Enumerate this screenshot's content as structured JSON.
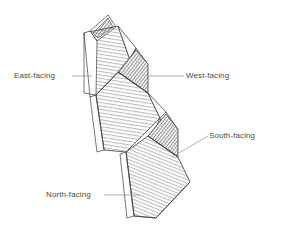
{
  "figure": {
    "kind": "architectural-isometric-line-drawing",
    "background_color": "#ffffff",
    "line_color": "#3c3c3c",
    "hatch_light_color": "#6e6e6e",
    "hatch_dark_color": "#2b2b2b",
    "leader_color": "#9a9a9a",
    "label_color": "#4a4a4a"
  },
  "labels": {
    "east": "East-facing",
    "west": "West-facing",
    "south": "South-facing",
    "north": "North-facing"
  },
  "panels": [
    {
      "id": "east",
      "name": "East-facing",
      "shading": "light-horizontal-hatch",
      "label": "East-facing"
    },
    {
      "id": "west",
      "name": "West-facing",
      "shading": "dark-dense-hatch",
      "label": "West-facing"
    },
    {
      "id": "south",
      "name": "South-facing",
      "shading": "dark-dense-hatch",
      "label": "South-facing"
    },
    {
      "id": "north",
      "name": "North-facing",
      "shading": "light-diagonal-hatch",
      "label": "North-facing"
    }
  ],
  "leaders": [
    {
      "id": "east-leader",
      "from": "East-facing",
      "style": "horizontal"
    },
    {
      "id": "west-leader",
      "from": "West-facing",
      "style": "horizontal"
    },
    {
      "id": "south-leader",
      "from": "South-facing",
      "style": "diagonal"
    },
    {
      "id": "north-leader",
      "from": "North-facing",
      "style": "horizontal"
    }
  ]
}
